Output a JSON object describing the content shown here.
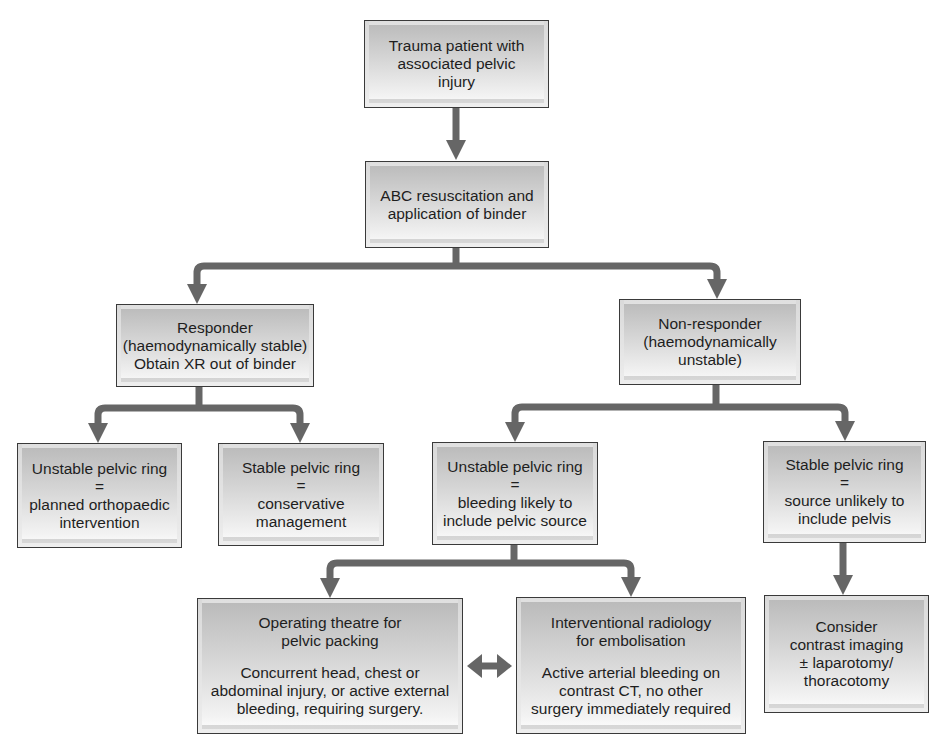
{
  "diagram": {
    "colors": {
      "connector": "#666666",
      "box_border": "#3a3a3a",
      "text": "#1e1e1e"
    },
    "nodes": {
      "start": {
        "lines": [
          "Trauma patient with",
          "associated pelvic",
          "injury"
        ]
      },
      "abc": {
        "lines": [
          "ABC resuscitation and",
          "application of binder"
        ]
      },
      "responder": {
        "lines": [
          "Responder",
          "(haemodynamically stable)",
          "Obtain XR out of binder"
        ]
      },
      "non_responder": {
        "lines": [
          "Non-responder",
          "(haemodynamically",
          "unstable)"
        ]
      },
      "unstable_ortho": {
        "lines": [
          "Unstable pelvic ring",
          "=",
          "planned orthopaedic",
          "intervention"
        ]
      },
      "stable_conservative": {
        "lines": [
          "Stable pelvic ring",
          "=",
          "conservative",
          "management"
        ]
      },
      "unstable_bleeding": {
        "lines": [
          "Unstable pelvic ring",
          "=",
          "bleeding likely to",
          "include pelvic source"
        ]
      },
      "stable_source": {
        "lines": [
          "Stable pelvic ring",
          "=",
          "source unlikely to",
          "include pelvis"
        ]
      },
      "operating_theatre": {
        "heading": [
          "Operating theatre for",
          "pelvic packing"
        ],
        "detail": [
          "Concurrent head, chest or",
          "abdominal injury, or active external",
          "bleeding, requiring surgery."
        ]
      },
      "interventional_radiology": {
        "heading": [
          "Interventional radiology",
          "for embolisation"
        ],
        "detail": [
          "Active arterial bleeding on",
          "contrast CT, no other",
          "surgery immediately required"
        ]
      },
      "consider_imaging": {
        "lines": [
          "Consider",
          "contrast imaging",
          "± laparotomy/",
          "thoracotomy"
        ]
      }
    },
    "edges": [
      {
        "from": "start",
        "to": "abc"
      },
      {
        "from": "abc",
        "to": "responder"
      },
      {
        "from": "abc",
        "to": "non_responder"
      },
      {
        "from": "responder",
        "to": "unstable_ortho"
      },
      {
        "from": "responder",
        "to": "stable_conservative"
      },
      {
        "from": "non_responder",
        "to": "unstable_bleeding"
      },
      {
        "from": "non_responder",
        "to": "stable_source"
      },
      {
        "from": "unstable_bleeding",
        "to": "operating_theatre"
      },
      {
        "from": "unstable_bleeding",
        "to": "interventional_radiology"
      },
      {
        "from": "stable_source",
        "to": "consider_imaging"
      },
      {
        "from": "operating_theatre",
        "to": "interventional_radiology",
        "bidirectional": true
      }
    ]
  }
}
